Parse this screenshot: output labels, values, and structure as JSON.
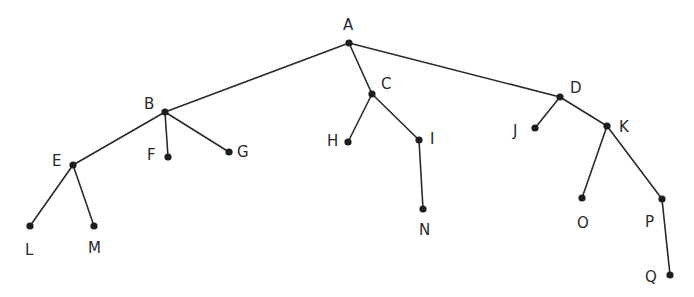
{
  "diagram": {
    "type": "tree",
    "root": "A",
    "nodes": [
      {
        "id": "A",
        "label": "A",
        "x": 349,
        "y": 43,
        "lx": 343,
        "ly": 30
      },
      {
        "id": "B",
        "label": "B",
        "x": 165,
        "y": 112,
        "lx": 144,
        "ly": 109
      },
      {
        "id": "C",
        "label": "C",
        "x": 372,
        "y": 94,
        "lx": 381,
        "ly": 89
      },
      {
        "id": "D",
        "label": "D",
        "x": 560,
        "y": 97,
        "lx": 570,
        "ly": 93
      },
      {
        "id": "E",
        "label": "E",
        "x": 73,
        "y": 165,
        "lx": 52,
        "ly": 166
      },
      {
        "id": "F",
        "label": "F",
        "x": 168,
        "y": 157,
        "lx": 147,
        "ly": 160
      },
      {
        "id": "G",
        "label": "G",
        "x": 229,
        "y": 152,
        "lx": 237,
        "ly": 157
      },
      {
        "id": "H",
        "label": "H",
        "x": 348,
        "y": 142,
        "lx": 327,
        "ly": 146
      },
      {
        "id": "I",
        "label": "I",
        "x": 419,
        "y": 140,
        "lx": 430,
        "ly": 144
      },
      {
        "id": "J",
        "label": "J",
        "x": 535,
        "y": 128,
        "lx": 513,
        "ly": 136
      },
      {
        "id": "K",
        "label": "K",
        "x": 607,
        "y": 126,
        "lx": 619,
        "ly": 132
      },
      {
        "id": "L",
        "label": "L",
        "x": 30,
        "y": 226,
        "lx": 25,
        "ly": 255
      },
      {
        "id": "M",
        "label": "M",
        "x": 94,
        "y": 226,
        "lx": 88,
        "ly": 253
      },
      {
        "id": "N",
        "label": "N",
        "x": 423,
        "y": 209,
        "lx": 419,
        "ly": 235
      },
      {
        "id": "O",
        "label": "O",
        "x": 582,
        "y": 198,
        "lx": 577,
        "ly": 228
      },
      {
        "id": "P",
        "label": "P",
        "x": 662,
        "y": 199,
        "lx": 645,
        "ly": 227
      },
      {
        "id": "Q",
        "label": "Q",
        "x": 670,
        "y": 275,
        "lx": 645,
        "ly": 282
      }
    ],
    "edges": [
      [
        "A",
        "B"
      ],
      [
        "A",
        "C"
      ],
      [
        "A",
        "D"
      ],
      [
        "B",
        "E"
      ],
      [
        "B",
        "F"
      ],
      [
        "B",
        "G"
      ],
      [
        "C",
        "H"
      ],
      [
        "C",
        "I"
      ],
      [
        "D",
        "J"
      ],
      [
        "D",
        "K"
      ],
      [
        "E",
        "L"
      ],
      [
        "E",
        "M"
      ],
      [
        "I",
        "N"
      ],
      [
        "K",
        "O"
      ],
      [
        "K",
        "P"
      ],
      [
        "P",
        "Q"
      ]
    ]
  }
}
